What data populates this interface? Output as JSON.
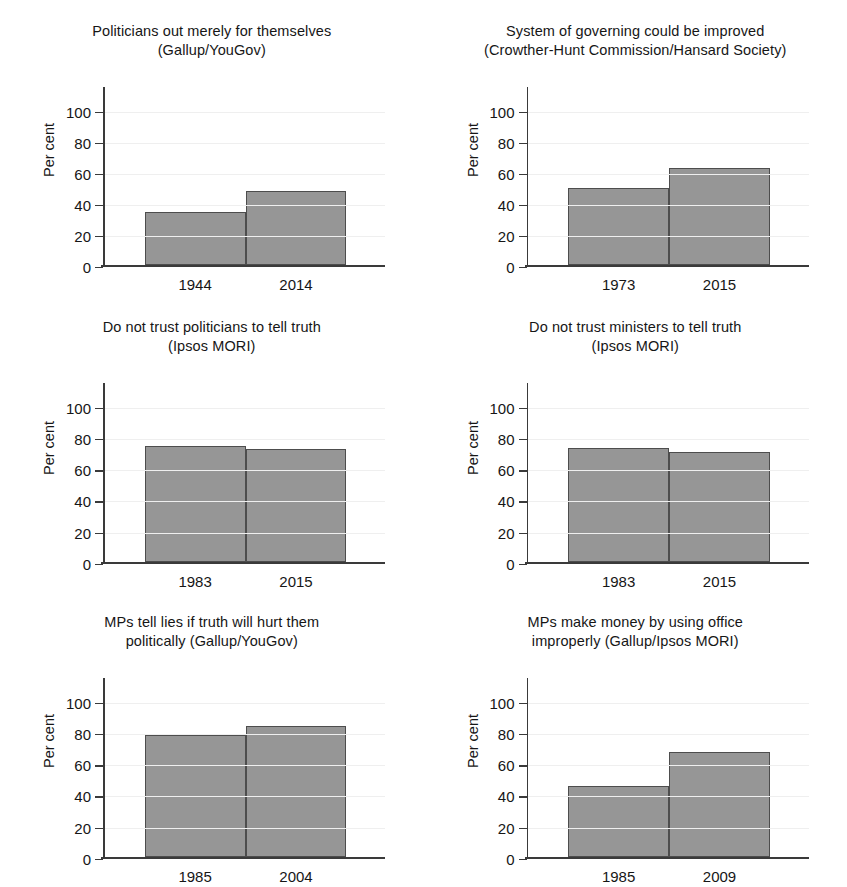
{
  "figure": {
    "panel_count": 6,
    "layout": "2 columns x 3 rows",
    "bar_color": "#969696",
    "bar_edge_color": "#4d4d4d",
    "axis_color": "#3a3a3a",
    "grid_color": "#efefef",
    "background": "#ffffff"
  },
  "axis": {
    "ylabel": "Per cent",
    "yticks": [
      "100",
      "80",
      "60",
      "40",
      "20",
      "0"
    ],
    "ytick_values": [
      100,
      80,
      60,
      40,
      20,
      0
    ],
    "ylim": [
      0,
      110
    ]
  },
  "chart_data": [
    {
      "type": "bar",
      "title": "Politicians out merely for themselves\n(Gallup/YouGov)",
      "title_line1": "Politicians out merely for themselves",
      "title_line2": "(Gallup/YouGov)",
      "source": "Gallup/YouGov",
      "categories": [
        "1944",
        "2014"
      ],
      "values": [
        35,
        48
      ],
      "xlabel": "",
      "ylabel": "Per cent",
      "ylim": [
        0,
        110
      ],
      "grid": true
    },
    {
      "type": "bar",
      "title": "System of governing could be improved\n(Crowther-Hunt Commission/Hansard Society)",
      "title_line1": "System of governing could be improved",
      "title_line2": "(Crowther-Hunt Commission/Hansard Society)",
      "source": "Crowther-Hunt Commission/Hansard Society",
      "categories": [
        "1973",
        "2015"
      ],
      "values": [
        50,
        63
      ],
      "xlabel": "",
      "ylabel": "Per cent",
      "ylim": [
        0,
        110
      ],
      "grid": true
    },
    {
      "type": "bar",
      "title": "Do not trust politicians to tell truth\n(Ipsos MORI)",
      "title_line1": "Do not trust politicians to tell truth",
      "title_line2": "(Ipsos MORI)",
      "source": "Ipsos MORI",
      "categories": [
        "1983",
        "2015"
      ],
      "values": [
        75,
        73
      ],
      "xlabel": "",
      "ylabel": "Per cent",
      "ylim": [
        0,
        110
      ],
      "grid": true
    },
    {
      "type": "bar",
      "title": "Do not trust ministers to tell truth\n(Ipsos MORI)",
      "title_line1": "Do not trust ministers to tell truth",
      "title_line2": "(Ipsos MORI)",
      "source": "Ipsos MORI",
      "categories": [
        "1983",
        "2015"
      ],
      "values": [
        74,
        71
      ],
      "xlabel": "",
      "ylabel": "Per cent",
      "ylim": [
        0,
        110
      ],
      "grid": true
    },
    {
      "type": "bar",
      "title": "MPs tell lies if truth will hurt them\npolitically (Gallup/YouGov)",
      "title_line1": "MPs tell lies if truth will hurt them",
      "title_line2": "politically (Gallup/YouGov)",
      "source": "Gallup/YouGov",
      "categories": [
        "1985",
        "2004"
      ],
      "values": [
        79,
        85
      ],
      "xlabel": "",
      "ylabel": "Per cent",
      "ylim": [
        0,
        110
      ],
      "grid": true
    },
    {
      "type": "bar",
      "title": "MPs make money by using office\nimproperly (Gallup/Ipsos MORI)",
      "title_line1": "MPs make money by using office",
      "title_line2": "improperly (Gallup/Ipsos MORI)",
      "source": "Gallup/Ipsos MORI",
      "categories": [
        "1985",
        "2009"
      ],
      "values": [
        46,
        68
      ],
      "xlabel": "",
      "ylabel": "Per cent",
      "ylim": [
        0,
        110
      ],
      "grid": true
    }
  ]
}
